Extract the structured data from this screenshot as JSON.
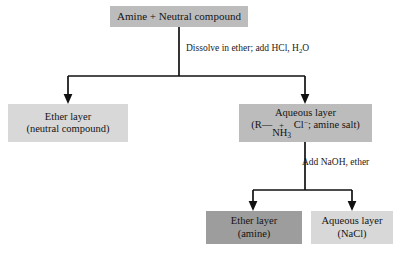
{
  "diagram": {
    "background_color": "#ffffff",
    "line_color": "#111111",
    "nodes": {
      "start": {
        "label": "Amine + Neutral compound",
        "fill": "#bcbcbc"
      },
      "ether_layer": {
        "line1": "Ether layer",
        "line2": "(neutral compound)",
        "fill": "#d8d8d8"
      },
      "aqueous_layer": {
        "line1": "Aqueous layer",
        "formula_open": "(R",
        "formula_dash": "—",
        "formula_nh": "NH",
        "formula_nh_sub": "3",
        "formula_charge": "+",
        "formula_cl": "Cl",
        "formula_cl_charge": "−",
        "formula_tail": "; amine salt)",
        "fill": "#bcbcbc"
      },
      "ether_amine": {
        "line1": "Ether layer",
        "line2": "(amine)",
        "fill": "#9d9d9d"
      },
      "aqueous_nacl": {
        "line1": "Aqueous layer",
        "line2": "(NaCl)",
        "fill": "#d8d8d8"
      }
    },
    "annotations": {
      "dissolve": {
        "line1": "Dissolve in ether;",
        "line2_pre": "add HCl, H",
        "line2_sub": "2",
        "line2_post": "O"
      },
      "add_naoh": {
        "line1": "Add NaOH, ether"
      }
    }
  }
}
